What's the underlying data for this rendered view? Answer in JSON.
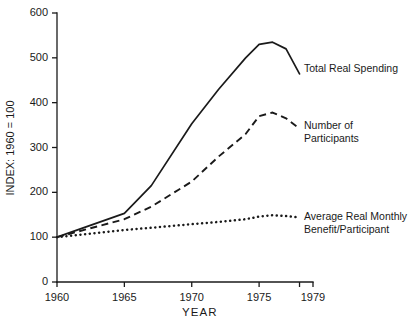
{
  "chart_data": {
    "type": "line",
    "title": "",
    "xlabel": "YEAR",
    "ylabel": "INDEX: 1960 = 100",
    "xlim": [
      1960,
      1979
    ],
    "ylim": [
      0,
      600
    ],
    "xticks": [
      1960,
      1965,
      1970,
      1975,
      1979
    ],
    "xticklabels": [
      "1960",
      "1965",
      "1970",
      "1975",
      "1979"
    ],
    "yticks": [
      0,
      100,
      200,
      300,
      400,
      500,
      600
    ],
    "yticklabels": [
      "0",
      "100",
      "200",
      "300",
      "400",
      "500",
      "600"
    ],
    "grid": false,
    "legend_position": "inline-right-labels",
    "series": [
      {
        "name": "Total Real Spending",
        "style": "solid",
        "color": "#1a1a1a",
        "x": [
          1960,
          1965,
          1967,
          1970,
          1972,
          1974,
          1975,
          1976,
          1977,
          1978
        ],
        "values": [
          100,
          153,
          215,
          353,
          430,
          500,
          530,
          535,
          520,
          464
        ]
      },
      {
        "name": "Number of Participants",
        "style": "dashed",
        "color": "#1a1a1a",
        "x": [
          1960,
          1965,
          1967,
          1970,
          1972,
          1974,
          1975,
          1976,
          1977,
          1978
        ],
        "values": [
          100,
          140,
          168,
          224,
          280,
          330,
          370,
          378,
          365,
          342
        ]
      },
      {
        "name": "Average Real Monthly\nBenefit/Participant",
        "style": "dotted",
        "color": "#1a1a1a",
        "x": [
          1960,
          1965,
          1967,
          1970,
          1972,
          1974,
          1975,
          1976,
          1977,
          1978
        ],
        "values": [
          100,
          116,
          121,
          129,
          134,
          140,
          146,
          149,
          147,
          144
        ]
      }
    ]
  },
  "annotations": {
    "total_real_spending": "Total Real Spending",
    "number_of_participants": "Number of Participants",
    "average_real_monthly_benefit": "Average Real Monthly\nBenefit/Participant"
  }
}
